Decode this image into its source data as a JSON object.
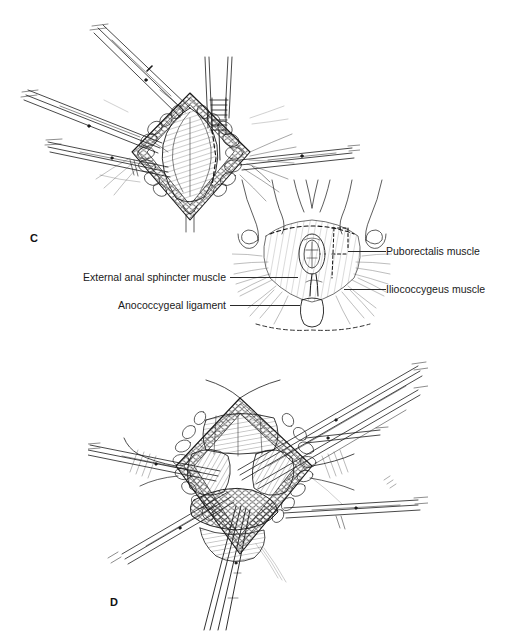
{
  "figure": {
    "background_color": "#ffffff",
    "ink_color": "#1a1a1a",
    "width": 511,
    "height": 631
  },
  "panels": [
    {
      "id": "C",
      "letter": "C",
      "caption": "Operative exposure of the intersphincteric plane with retractors in place"
    },
    {
      "id": "D",
      "letter": "D",
      "caption": "Deeper dissection of the levator ani with additional retraction"
    }
  ],
  "inset": {
    "name": "perineal-overview",
    "description": "Inferior view of the perineum showing pelvic floor musculature"
  },
  "annotations": [
    {
      "id": "external-anal-sphincter",
      "label": "External anal sphincter muscle",
      "side": "left"
    },
    {
      "id": "anococcygeal-ligament",
      "label": "Anococcygeal ligament",
      "side": "left"
    },
    {
      "id": "puborectalis",
      "label": "Puborectalis muscle",
      "side": "right"
    },
    {
      "id": "iliococcygeus",
      "label": "Iliococcygeus muscle",
      "side": "right"
    }
  ]
}
